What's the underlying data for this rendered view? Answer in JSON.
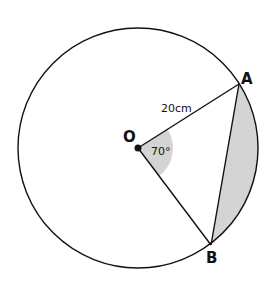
{
  "diagram": {
    "labels": {
      "center": "O",
      "point_a": "A",
      "point_b": "B",
      "radius": "20cm",
      "angle": "70°"
    },
    "measurements": {
      "radius_cm": 20,
      "central_angle_deg": 70
    },
    "colors": {
      "stroke": "#111111",
      "shade": "#d4d4d4",
      "background": "#ffffff"
    }
  }
}
